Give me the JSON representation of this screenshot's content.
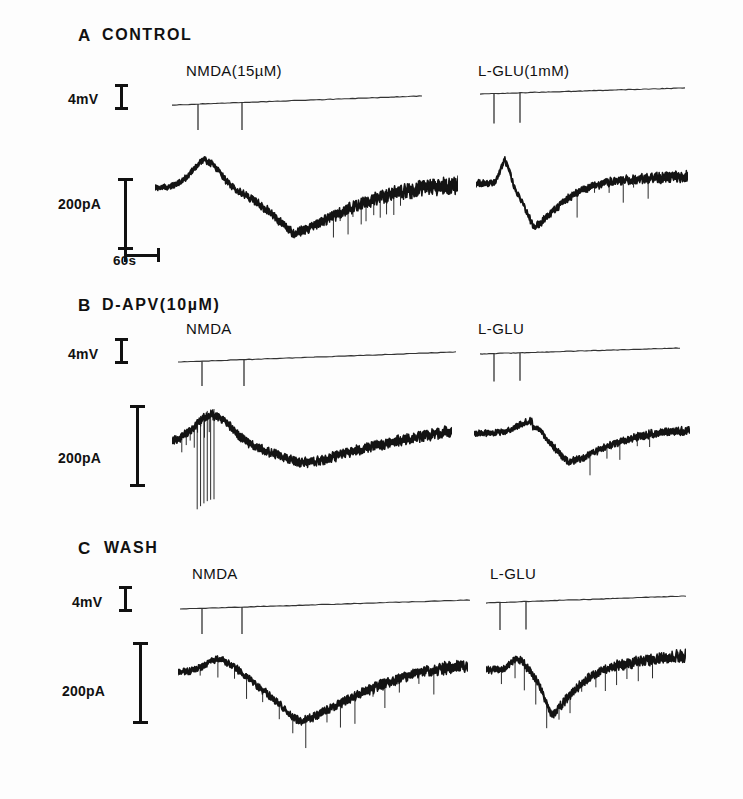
{
  "figure": {
    "width": 743,
    "height": 799,
    "background": "#fdfdfd",
    "ink": "#141414"
  },
  "panels": [
    {
      "id": "A",
      "letter": "A",
      "title": "CONTROL",
      "letter_x": 78,
      "letter_y": 26,
      "title_x": 102,
      "title_y": 26,
      "voltage_label": "4mV",
      "voltage_label_x": 68,
      "voltage_label_y": 91,
      "voltage_ibeam_x": 115,
      "voltage_ibeam_y": 84,
      "voltage_ibeam_h": 26,
      "current_label": "200pA",
      "current_label_x": 58,
      "current_label_y": 196,
      "current_bar_x": 118,
      "current_bar_y": 178,
      "current_bar_h": 72,
      "time_label": "60s",
      "time_label_x": 113,
      "time_label_y": 253,
      "time_bar": true,
      "time_bar_x": 118,
      "time_bar_y": 248,
      "time_bar_w": 36,
      "traces": [
        {
          "drug": "NMDA(15µM)",
          "drug_x": 186,
          "drug_y": 62,
          "volt_x": 172,
          "volt_y": 96,
          "volt_w": 250,
          "volt_slope": -9,
          "volt_ticks": [
            26,
            70
          ],
          "volt_tick_len": 28,
          "trace_x": 155,
          "trace_y": 148,
          "trace_w": 303,
          "trace_h": 110,
          "baseline": 0.36,
          "peak": 0.11,
          "peak_at": 0.17,
          "peak_w": 0.09,
          "trough": 0.95,
          "trough_at": 0.5,
          "trough_w": 0.17,
          "recover": 0.33,
          "noise": 0.022,
          "noise_late": 0.065,
          "spikes": 14,
          "spike_start": 0.58,
          "spike_len": 0.3,
          "seed": 11
        },
        {
          "drug": "L-GLU(1mM)",
          "drug_x": 478,
          "drug_y": 62,
          "volt_x": 480,
          "volt_y": 88,
          "volt_w": 205,
          "volt_slope": -6,
          "volt_ticks": [
            14,
            40
          ],
          "volt_tick_len": 30,
          "trace_x": 476,
          "trace_y": 152,
          "trace_w": 212,
          "trace_h": 98,
          "baseline": 0.32,
          "peak": 0.08,
          "peak_at": 0.14,
          "peak_w": 0.045,
          "trough": 0.96,
          "trough_at": 0.3,
          "trough_w": 0.1,
          "recover": 0.24,
          "noise": 0.028,
          "noise_late": 0.045,
          "spikes": 6,
          "spike_start": 0.45,
          "spike_len": 0.4,
          "seed": 23
        }
      ]
    },
    {
      "id": "B",
      "letter": "B",
      "title": "D-APV(10µM)",
      "letter_x": 78,
      "letter_y": 296,
      "title_x": 102,
      "title_y": 296,
      "voltage_label": "4mV",
      "voltage_label_x": 68,
      "voltage_label_y": 346,
      "voltage_ibeam_x": 115,
      "voltage_ibeam_y": 338,
      "voltage_ibeam_h": 26,
      "current_label": "200pA",
      "current_label_x": 58,
      "current_label_y": 450,
      "current_bar_x": 130,
      "current_bar_y": 405,
      "current_bar_h": 82,
      "time_label": "",
      "time_bar": false,
      "traces": [
        {
          "drug": "NMDA",
          "drug_x": 186,
          "drug_y": 320,
          "volt_x": 178,
          "volt_y": 352,
          "volt_w": 278,
          "volt_slope": -10,
          "volt_ticks": [
            24,
            66
          ],
          "volt_tick_len": 28,
          "trace_x": 172,
          "trace_y": 400,
          "trace_w": 280,
          "trace_h": 100,
          "baseline": 0.42,
          "peak": 0.14,
          "peak_at": 0.15,
          "peak_w": 0.12,
          "trough": 0.72,
          "trough_at": 0.52,
          "trough_w": 0.22,
          "recover": 0.3,
          "noise": 0.035,
          "noise_late": 0.045,
          "spikes": 9,
          "spike_start": 0.03,
          "spike_len": 0.12,
          "seed": 37,
          "big_spikes": 6,
          "big_spike_at": 0.09,
          "big_spike_len": 0.06,
          "big_spike_depth": 1.55
        },
        {
          "drug": "L-GLU",
          "drug_x": 478,
          "drug_y": 320,
          "volt_x": 480,
          "volt_y": 348,
          "volt_w": 200,
          "volt_slope": -6,
          "volt_ticks": [
            14,
            40
          ],
          "volt_tick_len": 28,
          "trace_x": 474,
          "trace_y": 404,
          "trace_w": 216,
          "trace_h": 86,
          "baseline": 0.34,
          "peak": 0.2,
          "peak_at": 0.27,
          "peak_w": 0.13,
          "trough": 0.82,
          "trough_at": 0.48,
          "trough_w": 0.16,
          "recover": 0.3,
          "noise": 0.03,
          "noise_late": 0.04,
          "spikes": 5,
          "spike_start": 0.5,
          "spike_len": 0.35,
          "seed": 51
        }
      ]
    },
    {
      "id": "C",
      "letter": "C",
      "title": "WASH",
      "letter_x": 78,
      "letter_y": 539,
      "title_x": 104,
      "title_y": 539,
      "voltage_label": "4mV",
      "voltage_label_x": 72,
      "voltage_label_y": 594,
      "voltage_ibeam_x": 119,
      "voltage_ibeam_y": 586,
      "voltage_ibeam_h": 26,
      "current_label": "200pA",
      "current_label_x": 62,
      "current_label_y": 683,
      "current_bar_x": 133,
      "current_bar_y": 642,
      "current_bar_h": 82,
      "time_label": "",
      "time_bar": false,
      "traces": [
        {
          "drug": "NMDA",
          "drug_x": 192,
          "drug_y": 565,
          "volt_x": 180,
          "volt_y": 600,
          "volt_w": 290,
          "volt_slope": -9,
          "volt_ticks": [
            22,
            62
          ],
          "volt_tick_len": 28,
          "trace_x": 178,
          "trace_y": 640,
          "trace_w": 290,
          "trace_h": 108,
          "baseline": 0.3,
          "peak": 0.17,
          "peak_at": 0.16,
          "peak_w": 0.11,
          "trough": 0.94,
          "trough_at": 0.47,
          "trough_w": 0.2,
          "recover": 0.22,
          "noise": 0.026,
          "noise_late": 0.045,
          "spikes": 16,
          "spike_start": 0.05,
          "spike_len": 0.85,
          "seed": 67
        },
        {
          "drug": "L-GLU",
          "drug_x": 490,
          "drug_y": 565,
          "volt_x": 486,
          "volt_y": 596,
          "volt_w": 200,
          "volt_slope": -7,
          "volt_ticks": [
            14,
            40
          ],
          "volt_tick_len": 28,
          "trace_x": 486,
          "trace_y": 642,
          "trace_w": 200,
          "trace_h": 100,
          "baseline": 0.28,
          "peak": 0.17,
          "peak_at": 0.16,
          "peak_w": 0.07,
          "trough": 0.92,
          "trough_at": 0.35,
          "trough_w": 0.09,
          "recover": 0.12,
          "noise": 0.03,
          "noise_late": 0.05,
          "spikes": 14,
          "spike_start": 0.05,
          "spike_len": 0.8,
          "seed": 83
        }
      ]
    }
  ],
  "chart_data": {
    "type": "line",
    "xlabel": "Time",
    "ylabel": "Membrane current",
    "x_scale_bar": "60s",
    "y_scale_bar": "200pA",
    "voltage_scale_bar": "4mV",
    "grid": false,
    "legend": "none",
    "conditions": [
      "CONTROL",
      "D-APV(10µM)",
      "WASH"
    ],
    "agonists": [
      "NMDA(15µM)",
      "L-GLU(1mM)"
    ],
    "series": [
      {
        "name": "CONTROL / NMDA(15µM)",
        "condition": "CONTROL",
        "agonist": "NMDA",
        "concentration": "15µM",
        "peak_outward_pA": 55,
        "peak_inward_pA": -230,
        "comment": "Large inward current, slow onset and slow recovery"
      },
      {
        "name": "CONTROL / L-GLU(1mM)",
        "condition": "CONTROL",
        "agonist": "L-GLU",
        "concentration": "1mM",
        "peak_outward_pA": 60,
        "peak_inward_pA": -215,
        "comment": "Sharp transient outward spike then fast large inward current"
      },
      {
        "name": "D-APV(10µM) / NMDA",
        "condition": "D-APV(10µM)",
        "agonist": "NMDA",
        "concentration": "15µM",
        "peak_outward_pA": 70,
        "peak_inward_pA": -90,
        "comment": "NMDA response strongly reduced by D-APV"
      },
      {
        "name": "D-APV(10µM) / L-GLU",
        "condition": "D-APV(10µM)",
        "agonist": "L-GLU",
        "concentration": "1mM",
        "peak_outward_pA": 35,
        "peak_inward_pA": -115,
        "comment": "L-GLU response partially reduced by D-APV"
      },
      {
        "name": "WASH / NMDA",
        "condition": "WASH",
        "agonist": "NMDA",
        "concentration": "15µM",
        "peak_outward_pA": 30,
        "peak_inward_pA": -225,
        "comment": "NMDA response recovers after wash"
      },
      {
        "name": "WASH / L-GLU",
        "condition": "WASH",
        "agonist": "L-GLU",
        "concentration": "1mM",
        "peak_outward_pA": 25,
        "peak_inward_pA": -215,
        "comment": "L-GLU response recovers after wash"
      }
    ]
  }
}
